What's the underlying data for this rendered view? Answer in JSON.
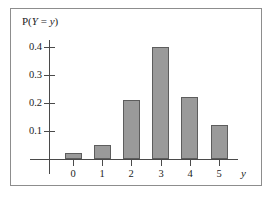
{
  "figure": {
    "axis_color": "#4a4a4a",
    "frame_color": "#8d8d8d",
    "bar_fill": "#9a9a9a",
    "bar_stroke": "#5d5d5d",
    "background": "#ffffff"
  },
  "labels": {
    "y_axis_title_prefix": "P(",
    "y_axis_title_var1": "Y",
    "y_axis_title_eq": " = ",
    "y_axis_title_var2": "y",
    "y_axis_title_suffix": ")",
    "y_axis_title_full": "P(Y = y)",
    "x_axis_title": "y"
  },
  "chart_data": {
    "type": "bar",
    "title": "",
    "subtitle": "",
    "xlabel": "y",
    "ylabel": "P(Y = y)",
    "categories": [
      "0",
      "1",
      "2",
      "3",
      "4",
      "5"
    ],
    "values": [
      0.02,
      0.05,
      0.21,
      0.4,
      0.22,
      0.12
    ],
    "ylim": [
      0,
      0.45
    ],
    "xlim": [
      -0.8,
      5.9
    ],
    "ytick_labels": [
      "0.1",
      "0.2",
      "0.3",
      "0.4"
    ],
    "ytick_values": [
      0.1,
      0.2,
      0.3,
      0.4
    ],
    "xtick_labels": [
      "0",
      "1",
      "2",
      "3",
      "4",
      "5"
    ],
    "grid": false,
    "legend": null,
    "annotations": []
  }
}
